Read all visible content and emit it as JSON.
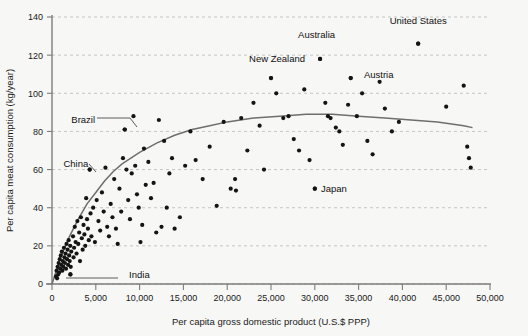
{
  "chart_data": {
    "type": "scatter",
    "title": "",
    "xlabel": "Per capita gross domestic product (U.S.$ PPP)",
    "ylabel": "Per capita meat consumption (kg/year)",
    "xlim": [
      0,
      50000
    ],
    "ylim": [
      0,
      140
    ],
    "xticks": [
      0,
      5000,
      10000,
      15000,
      20000,
      25000,
      30000,
      35000,
      40000,
      45000,
      50000
    ],
    "xticklabels": [
      "0",
      "5,000",
      "10,000",
      "15,000",
      "20,000",
      "25,000",
      "30,000",
      "35,000",
      "40,000",
      "45,000",
      "50,000"
    ],
    "yticks": [
      0,
      20,
      40,
      60,
      80,
      100,
      120,
      140
    ],
    "yticklabels": [
      "0",
      "20",
      "40",
      "60",
      "80",
      "100",
      "120",
      "140"
    ],
    "grid": true,
    "grid_axis": "y",
    "legend": "none",
    "point_color": "#141414",
    "curve_color": "#6e6e6e",
    "grid_color": "#b9b9b9",
    "background": "#f7f7f5",
    "annotations": [
      {
        "text": "United States",
        "x": 41800,
        "y": 138,
        "anchor": "middle",
        "leader": false
      },
      {
        "text": "Australia",
        "x": 30200,
        "y": 131,
        "anchor": "middle",
        "leader": false
      },
      {
        "text": "New Zealand",
        "x": 25700,
        "y": 118,
        "anchor": "middle",
        "leader": false
      },
      {
        "text": "Austria",
        "x": 35600,
        "y": 110,
        "anchor": "start",
        "leader": false
      },
      {
        "text": "Japan",
        "x": 30700,
        "y": 50,
        "anchor": "start",
        "leader": false
      },
      {
        "text": "Brazil",
        "x": 2200,
        "y": 86,
        "anchor": "start",
        "leader": true
      },
      {
        "text": "China",
        "x": 1300,
        "y": 63,
        "anchor": "start",
        "leader": true
      },
      {
        "text": "India",
        "x": 8800,
        "y": 5,
        "anchor": "start",
        "leader": true
      }
    ],
    "labeled_points": [
      {
        "name": "United States",
        "x": 41800,
        "y": 126
      },
      {
        "name": "Australia",
        "x": 30600,
        "y": 118
      },
      {
        "name": "New Zealand",
        "x": 25000,
        "y": 108
      },
      {
        "name": "Austria",
        "x": 34100,
        "y": 108
      },
      {
        "name": "Japan",
        "x": 30000,
        "y": 50
      },
      {
        "name": "Brazil",
        "x": 8300,
        "y": 81
      },
      {
        "name": "China",
        "x": 4300,
        "y": 60
      },
      {
        "name": "India",
        "x": 2100,
        "y": 5
      }
    ],
    "points": [
      [
        460,
        4
      ],
      [
        520,
        7
      ],
      [
        580,
        3
      ],
      [
        640,
        9
      ],
      [
        700,
        5
      ],
      [
        760,
        11
      ],
      [
        820,
        6
      ],
      [
        880,
        13
      ],
      [
        940,
        8
      ],
      [
        1000,
        15
      ],
      [
        1060,
        10
      ],
      [
        1120,
        17
      ],
      [
        1180,
        7
      ],
      [
        1240,
        12
      ],
      [
        1300,
        9
      ],
      [
        1360,
        19
      ],
      [
        1420,
        14
      ],
      [
        1480,
        11
      ],
      [
        1540,
        16
      ],
      [
        1600,
        8
      ],
      [
        1660,
        21
      ],
      [
        1720,
        13
      ],
      [
        1780,
        18
      ],
      [
        1840,
        10
      ],
      [
        1900,
        23
      ],
      [
        1960,
        15
      ],
      [
        2020,
        12
      ],
      [
        2080,
        20
      ],
      [
        2140,
        9
      ],
      [
        2200,
        17
      ],
      [
        2100,
        5
      ],
      [
        2400,
        25
      ],
      [
        2460,
        14
      ],
      [
        2520,
        19
      ],
      [
        2600,
        30
      ],
      [
        2700,
        22
      ],
      [
        2800,
        16
      ],
      [
        2900,
        33
      ],
      [
        3000,
        21
      ],
      [
        3100,
        27
      ],
      [
        3200,
        12
      ],
      [
        3300,
        35
      ],
      [
        3400,
        24
      ],
      [
        3500,
        18
      ],
      [
        3600,
        31
      ],
      [
        3700,
        26
      ],
      [
        3800,
        20
      ],
      [
        3900,
        45
      ],
      [
        4000,
        34
      ],
      [
        4100,
        29
      ],
      [
        4200,
        23
      ],
      [
        4300,
        60
      ],
      [
        4400,
        37
      ],
      [
        4500,
        25
      ],
      [
        4700,
        40
      ],
      [
        4900,
        22
      ],
      [
        5100,
        44
      ],
      [
        5300,
        33
      ],
      [
        5500,
        28
      ],
      [
        5700,
        48
      ],
      [
        5900,
        38
      ],
      [
        6100,
        61
      ],
      [
        6300,
        30
      ],
      [
        6500,
        25
      ],
      [
        6700,
        42
      ],
      [
        6900,
        35
      ],
      [
        7100,
        55
      ],
      [
        7300,
        29
      ],
      [
        7500,
        21
      ],
      [
        7700,
        50
      ],
      [
        7900,
        38
      ],
      [
        8100,
        66
      ],
      [
        8300,
        81
      ],
      [
        8500,
        60
      ],
      [
        8700,
        44
      ],
      [
        8900,
        34
      ],
      [
        9100,
        58
      ],
      [
        9300,
        88
      ],
      [
        9500,
        62
      ],
      [
        9700,
        47
      ],
      [
        9900,
        40
      ],
      [
        10100,
        22
      ],
      [
        10300,
        31
      ],
      [
        10500,
        71
      ],
      [
        10700,
        52
      ],
      [
        11000,
        64
      ],
      [
        11300,
        45
      ],
      [
        11600,
        53
      ],
      [
        11900,
        27
      ],
      [
        12200,
        86
      ],
      [
        12500,
        30
      ],
      [
        12800,
        75
      ],
      [
        13100,
        40
      ],
      [
        13400,
        58
      ],
      [
        13700,
        66
      ],
      [
        14000,
        29
      ],
      [
        14600,
        35
      ],
      [
        15200,
        62
      ],
      [
        15800,
        80
      ],
      [
        16400,
        65
      ],
      [
        17200,
        55
      ],
      [
        18000,
        72
      ],
      [
        18800,
        41
      ],
      [
        19600,
        85
      ],
      [
        20400,
        50
      ],
      [
        20900,
        55
      ],
      [
        21000,
        49
      ],
      [
        21600,
        87
      ],
      [
        22300,
        70
      ],
      [
        23000,
        95
      ],
      [
        23700,
        83
      ],
      [
        24200,
        60
      ],
      [
        25000,
        108
      ],
      [
        25600,
        100
      ],
      [
        26400,
        87
      ],
      [
        27000,
        88
      ],
      [
        27600,
        76
      ],
      [
        28200,
        70
      ],
      [
        28800,
        102
      ],
      [
        29400,
        65
      ],
      [
        30000,
        50
      ],
      [
        30600,
        118
      ],
      [
        31200,
        95
      ],
      [
        31500,
        88
      ],
      [
        31800,
        87
      ],
      [
        32400,
        82
      ],
      [
        32800,
        80
      ],
      [
        33200,
        73
      ],
      [
        33800,
        94
      ],
      [
        34100,
        108
      ],
      [
        34800,
        88
      ],
      [
        35400,
        100
      ],
      [
        36000,
        75
      ],
      [
        36600,
        68
      ],
      [
        37400,
        106
      ],
      [
        38000,
        92
      ],
      [
        38800,
        80
      ],
      [
        39600,
        85
      ],
      [
        41800,
        126
      ],
      [
        45000,
        93
      ],
      [
        47000,
        104
      ],
      [
        47400,
        72
      ],
      [
        47600,
        66
      ],
      [
        47800,
        61
      ]
    ],
    "fit_curve": [
      [
        0,
        0
      ],
      [
        1000,
        14
      ],
      [
        2000,
        25
      ],
      [
        3000,
        34
      ],
      [
        4000,
        42
      ],
      [
        5000,
        48
      ],
      [
        6000,
        54
      ],
      [
        7000,
        59
      ],
      [
        8000,
        63
      ],
      [
        9000,
        66
      ],
      [
        10000,
        69
      ],
      [
        12000,
        74
      ],
      [
        14000,
        78
      ],
      [
        16000,
        81
      ],
      [
        18000,
        83
      ],
      [
        20000,
        85
      ],
      [
        23000,
        87
      ],
      [
        26000,
        88
      ],
      [
        29000,
        89
      ],
      [
        32000,
        89
      ],
      [
        35000,
        88
      ],
      [
        38000,
        87
      ],
      [
        41000,
        86
      ],
      [
        44000,
        85
      ],
      [
        47000,
        83
      ],
      [
        48000,
        82
      ]
    ]
  }
}
